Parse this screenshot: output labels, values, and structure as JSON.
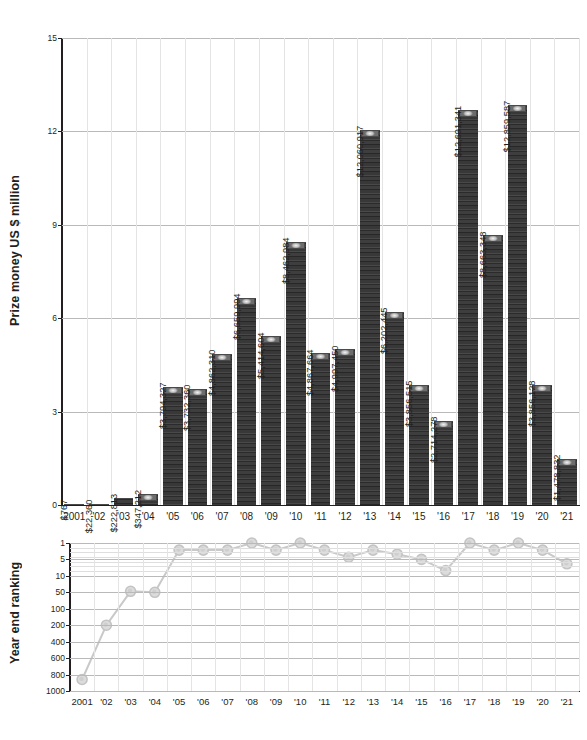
{
  "chart_data": [
    {
      "type": "bar",
      "title": "",
      "xlabel": "",
      "ylabel": "Prize money US $ million",
      "ylim": [
        0,
        15
      ],
      "yticks": [
        0,
        3,
        6,
        9,
        12,
        15
      ],
      "ytick_labels": [
        "0",
        "3",
        "6",
        "9",
        "12",
        "15"
      ],
      "grid": true,
      "legend": "none",
      "categories": [
        "2001",
        "'02",
        "'03",
        "'04",
        "'05",
        "'06",
        "'07",
        "'08",
        "'09",
        "'10",
        "'11",
        "'12",
        "'13",
        "'14",
        "'15",
        "'16",
        "'17",
        "'18",
        "'19",
        "'20",
        "'21"
      ],
      "values": [
        0.000767,
        0.02236,
        0.222813,
        0.347212,
        3.794327,
        3.73236,
        4.86231,
        6.659994,
        5.414604,
        8.462984,
        4.867664,
        4.99745,
        12.060917,
        6.202445,
        3.856515,
        2.714278,
        12.691341,
        8.663348,
        12.859587,
        3.856128,
        1.478832
      ],
      "data_labels": [
        "$767",
        "$22,360",
        "$222,813",
        "$347,212",
        "$3,794,327",
        "$3,732,360",
        "$4,862,310",
        "$6,659,994",
        "$5,414,604",
        "$8,462,984",
        "$4,867,664",
        "$4,997,450",
        "$12,060,917",
        "$6,202,445",
        "$3,856,515",
        "$2,714,278",
        "$12,691,341",
        "$8,663,348",
        "$12,859,587",
        "$3,856,128",
        "$1,478,832"
      ]
    },
    {
      "type": "line",
      "title": "",
      "xlabel": "",
      "ylabel": "Year end ranking",
      "yticks": [
        1,
        5,
        10,
        50,
        100,
        200,
        400,
        600,
        800,
        1000
      ],
      "ytick_labels": [
        "1",
        "5",
        "10",
        "50",
        "100",
        "200",
        "400",
        "600",
        "800",
        "1000"
      ],
      "y_axis_inverted": true,
      "y_axis_scale": "ordinal-log",
      "grid": true,
      "legend": "none",
      "categories": [
        "2001",
        "'02",
        "'03",
        "'04",
        "'05",
        "'06",
        "'07",
        "'08",
        "'09",
        "'10",
        "'11",
        "'12",
        "'13",
        "'14",
        "'15",
        "'16",
        "'17",
        "'18",
        "'19",
        "'20",
        "'21"
      ],
      "values": [
        856,
        200,
        45,
        50,
        2,
        2,
        2,
        1,
        2,
        1,
        2,
        4,
        2,
        3,
        5,
        8,
        1,
        2,
        1,
        2,
        6
      ]
    }
  ],
  "bar_chart": {
    "y_axis_title": "Prize money US $ million",
    "y_ticks": [
      "0",
      "3",
      "6",
      "9",
      "12",
      "15"
    ],
    "x_ticks": [
      "2001",
      "'02",
      "'03",
      "'04",
      "'05",
      "'06",
      "'07",
      "'08",
      "'09",
      "'10",
      "'11",
      "'12",
      "'13",
      "'14",
      "'15",
      "'16",
      "'17",
      "'18",
      "'19",
      "'20",
      "'21"
    ],
    "bars": [
      {
        "year": "2001",
        "label": "$767",
        "value": 0.000767
      },
      {
        "year": "'02",
        "label": "$22,360",
        "value": 0.02236
      },
      {
        "year": "'03",
        "label": "$222,813",
        "value": 0.222813
      },
      {
        "year": "'04",
        "label": "$347,212",
        "value": 0.347212
      },
      {
        "year": "'05",
        "label": "$3,794,327",
        "value": 3.794327
      },
      {
        "year": "'06",
        "label": "$3,732,360",
        "value": 3.73236
      },
      {
        "year": "'07",
        "label": "$4,862,310",
        "value": 4.86231
      },
      {
        "year": "'08",
        "label": "$6,659,994",
        "value": 6.659994
      },
      {
        "year": "'09",
        "label": "$5,414,604",
        "value": 5.414604
      },
      {
        "year": "'10",
        "label": "$8,462,984",
        "value": 8.462984
      },
      {
        "year": "'11",
        "label": "$4,867,664",
        "value": 4.867664
      },
      {
        "year": "'12",
        "label": "$4,997,450",
        "value": 4.99745
      },
      {
        "year": "'13",
        "label": "$12,060,917",
        "value": 12.060917
      },
      {
        "year": "'14",
        "label": "$6,202,445",
        "value": 6.202445
      },
      {
        "year": "'15",
        "label": "$3,856,515",
        "value": 3.856515
      },
      {
        "year": "'16",
        "label": "$2,714,278",
        "value": 2.714278
      },
      {
        "year": "'17",
        "label": "$12,691,341",
        "value": 12.691341
      },
      {
        "year": "'18",
        "label": "$8,663,348",
        "value": 8.663348
      },
      {
        "year": "'19",
        "label": "$12,859,587",
        "value": 12.859587
      },
      {
        "year": "'20",
        "label": "$3,856,128",
        "value": 3.856128
      },
      {
        "year": "'21",
        "label": "$1,478,832",
        "value": 1.478832
      }
    ]
  },
  "rank_chart": {
    "y_axis_title": "Year end ranking",
    "y_ticks": [
      "1",
      "5",
      "10",
      "50",
      "100",
      "200",
      "400",
      "600",
      "800",
      "1000"
    ],
    "x_ticks": [
      "2001",
      "'02",
      "'03",
      "'04",
      "'05",
      "'06",
      "'07",
      "'08",
      "'09",
      "'10",
      "'11",
      "'12",
      "'13",
      "'14",
      "'15",
      "'16",
      "'17",
      "'18",
      "'19",
      "'20",
      "'21"
    ],
    "points": [
      {
        "year": "2001",
        "rank": 856
      },
      {
        "year": "'02",
        "rank": 200
      },
      {
        "year": "'03",
        "rank": 45
      },
      {
        "year": "'04",
        "rank": 50
      },
      {
        "year": "'05",
        "rank": 2
      },
      {
        "year": "'06",
        "rank": 2
      },
      {
        "year": "'07",
        "rank": 2
      },
      {
        "year": "'08",
        "rank": 1
      },
      {
        "year": "'09",
        "rank": 2
      },
      {
        "year": "'10",
        "rank": 1
      },
      {
        "year": "'11",
        "rank": 2
      },
      {
        "year": "'12",
        "rank": 4
      },
      {
        "year": "'13",
        "rank": 2
      },
      {
        "year": "'14",
        "rank": 3
      },
      {
        "year": "'15",
        "rank": 5
      },
      {
        "year": "'16",
        "rank": 8
      },
      {
        "year": "'17",
        "rank": 1
      },
      {
        "year": "'18",
        "rank": 2
      },
      {
        "year": "'19",
        "rank": 1
      },
      {
        "year": "'20",
        "rank": 2
      },
      {
        "year": "'21",
        "rank": 6
      }
    ]
  },
  "colors": {
    "bar_fill": "#343434",
    "axis": "#231f20",
    "gridline": "#b9b9b9",
    "line_series": "#c9c9c9",
    "marker": "#d4d4d4",
    "background": "#ffffff"
  }
}
